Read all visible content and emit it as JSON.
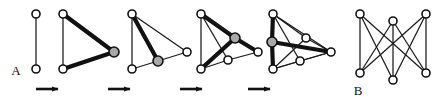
{
  "figure": {
    "background_color": "#ffffff",
    "width": 440,
    "height": 105,
    "colors": {
      "edge_thin": "#1a1a1a",
      "edge_thick": "#111111",
      "node_fill_white": "#ffffff",
      "node_fill_gray": "#a8a8a8",
      "node_stroke": "#111111",
      "arrow": "#111111",
      "label": "#111111"
    },
    "labels": [
      {
        "name": "label-A",
        "text": "A",
        "x": 16,
        "y": 75
      },
      {
        "name": "label-B",
        "text": "B",
        "x": 358,
        "y": 95
      }
    ],
    "arrows": [
      {
        "name": "arrow-1",
        "x1": 36,
        "y1": 89,
        "x2": 64,
        "y2": 89
      },
      {
        "name": "arrow-2",
        "x1": 108,
        "y1": 89,
        "x2": 136,
        "y2": 89
      },
      {
        "name": "arrow-3",
        "x1": 180,
        "y1": 89,
        "x2": 208,
        "y2": 89
      },
      {
        "name": "arrow-4",
        "x1": 248,
        "y1": 89,
        "x2": 276,
        "y2": 89
      }
    ],
    "panels": [
      {
        "name": "graph-panel-1",
        "caption": "A",
        "node_count": 2,
        "edge_count": 1,
        "nodes": [
          {
            "id": "n1",
            "x": 36,
            "y": 14,
            "fill": "white",
            "r": 4
          },
          {
            "id": "n2",
            "x": 36,
            "y": 69,
            "fill": "white",
            "r": 4
          }
        ],
        "edges": [
          {
            "from": "n1",
            "to": "n2",
            "weight": "thin"
          }
        ]
      },
      {
        "name": "graph-panel-2",
        "caption": "",
        "node_count": 3,
        "edge_count": 3,
        "nodes": [
          {
            "id": "n1",
            "x": 63,
            "y": 14,
            "fill": "white",
            "r": 4
          },
          {
            "id": "n2",
            "x": 63,
            "y": 69,
            "fill": "white",
            "r": 4
          },
          {
            "id": "n3",
            "x": 114,
            "y": 52,
            "fill": "gray",
            "r": 5
          }
        ],
        "edges": [
          {
            "from": "n1",
            "to": "n2",
            "weight": "thin"
          },
          {
            "from": "n1",
            "to": "n3",
            "weight": "thick"
          },
          {
            "from": "n2",
            "to": "n3",
            "weight": "thick"
          }
        ]
      },
      {
        "name": "graph-panel-3",
        "caption": "",
        "node_count": 4,
        "edge_count": 5,
        "nodes": [
          {
            "id": "n1",
            "x": 132,
            "y": 14,
            "fill": "white",
            "r": 4
          },
          {
            "id": "n2",
            "x": 132,
            "y": 69,
            "fill": "white",
            "r": 4
          },
          {
            "id": "n3",
            "x": 187,
            "y": 52,
            "fill": "white",
            "r": 4
          },
          {
            "id": "n4",
            "x": 158,
            "y": 61,
            "fill": "gray",
            "r": 5
          }
        ],
        "edges": [
          {
            "from": "n1",
            "to": "n2",
            "weight": "thin"
          },
          {
            "from": "n1",
            "to": "n3",
            "weight": "thin"
          },
          {
            "from": "n1",
            "to": "n4",
            "weight": "thick"
          },
          {
            "from": "n2",
            "to": "n4",
            "weight": "thin"
          },
          {
            "from": "n3",
            "to": "n4",
            "weight": "thin"
          }
        ]
      },
      {
        "name": "graph-panel-4",
        "caption": "",
        "node_count": 5,
        "edge_count": 8,
        "nodes": [
          {
            "id": "n1",
            "x": 201,
            "y": 14,
            "fill": "white",
            "r": 4
          },
          {
            "id": "n2",
            "x": 201,
            "y": 69,
            "fill": "white",
            "r": 4
          },
          {
            "id": "n3",
            "x": 258,
            "y": 52,
            "fill": "white",
            "r": 4
          },
          {
            "id": "n4",
            "x": 235,
            "y": 38,
            "fill": "gray",
            "r": 5
          },
          {
            "id": "n5",
            "x": 228,
            "y": 60,
            "fill": "white",
            "r": 4
          }
        ],
        "edges": [
          {
            "from": "n1",
            "to": "n2",
            "weight": "thin"
          },
          {
            "from": "n1",
            "to": "n4",
            "weight": "thick"
          },
          {
            "from": "n1",
            "to": "n5",
            "weight": "thin"
          },
          {
            "from": "n1",
            "to": "n3",
            "weight": "thin"
          },
          {
            "from": "n2",
            "to": "n4",
            "weight": "thick"
          },
          {
            "from": "n2",
            "to": "n5",
            "weight": "thin"
          },
          {
            "from": "n3",
            "to": "n4",
            "weight": "thick"
          },
          {
            "from": "n3",
            "to": "n5",
            "weight": "thin"
          }
        ]
      },
      {
        "name": "graph-panel-5",
        "caption": "",
        "node_count": 6,
        "edge_count": 11,
        "nodes": [
          {
            "id": "n1",
            "x": 273,
            "y": 14,
            "fill": "white",
            "r": 4
          },
          {
            "id": "n2",
            "x": 273,
            "y": 69,
            "fill": "white",
            "r": 4
          },
          {
            "id": "n3",
            "x": 331,
            "y": 52,
            "fill": "white",
            "r": 4
          },
          {
            "id": "n4",
            "x": 306,
            "y": 38,
            "fill": "white",
            "r": 4
          },
          {
            "id": "n5",
            "x": 300,
            "y": 61,
            "fill": "white",
            "r": 4
          },
          {
            "id": "n6",
            "x": 272,
            "y": 42,
            "fill": "gray",
            "r": 5
          }
        ],
        "edges": [
          {
            "from": "n1",
            "to": "n6",
            "weight": "thick"
          },
          {
            "from": "n6",
            "to": "n2",
            "weight": "thick"
          },
          {
            "from": "n6",
            "to": "n3",
            "weight": "thick"
          },
          {
            "from": "n1",
            "to": "n4",
            "weight": "thin"
          },
          {
            "from": "n1",
            "to": "n5",
            "weight": "thin"
          },
          {
            "from": "n1",
            "to": "n3",
            "weight": "thin"
          },
          {
            "from": "n2",
            "to": "n4",
            "weight": "thin"
          },
          {
            "from": "n2",
            "to": "n5",
            "weight": "thin"
          },
          {
            "from": "n2",
            "to": "n3",
            "weight": "thin"
          },
          {
            "from": "n3",
            "to": "n4",
            "weight": "thin"
          },
          {
            "from": "n3",
            "to": "n5",
            "weight": "thin"
          }
        ]
      },
      {
        "name": "graph-panel-b",
        "caption": "B",
        "node_count": 6,
        "edge_count": 9,
        "graph_type": "K3,3 complete bipartite",
        "nodes": [
          {
            "id": "t1",
            "x": 360,
            "y": 14,
            "fill": "white",
            "r": 4
          },
          {
            "id": "t2",
            "x": 393,
            "y": 21,
            "fill": "white",
            "r": 4
          },
          {
            "id": "t3",
            "x": 426,
            "y": 14,
            "fill": "white",
            "r": 4
          },
          {
            "id": "b1",
            "x": 360,
            "y": 73,
            "fill": "white",
            "r": 4
          },
          {
            "id": "b2",
            "x": 393,
            "y": 80,
            "fill": "white",
            "r": 4
          },
          {
            "id": "b3",
            "x": 426,
            "y": 73,
            "fill": "white",
            "r": 4
          }
        ],
        "edges": [
          {
            "from": "t1",
            "to": "b1",
            "weight": "thin"
          },
          {
            "from": "t1",
            "to": "b2",
            "weight": "thin"
          },
          {
            "from": "t1",
            "to": "b3",
            "weight": "thin"
          },
          {
            "from": "t2",
            "to": "b1",
            "weight": "thin"
          },
          {
            "from": "t2",
            "to": "b2",
            "weight": "thin"
          },
          {
            "from": "t2",
            "to": "b3",
            "weight": "thin"
          },
          {
            "from": "t3",
            "to": "b1",
            "weight": "thin"
          },
          {
            "from": "t3",
            "to": "b2",
            "weight": "thin"
          },
          {
            "from": "t3",
            "to": "b3",
            "weight": "thin"
          }
        ]
      }
    ]
  }
}
